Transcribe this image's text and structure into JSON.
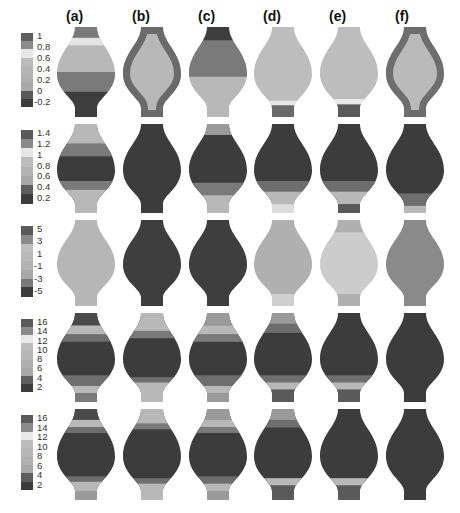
{
  "figure": {
    "column_labels": [
      "(a)",
      "(b)",
      "(c)",
      "(d)",
      "(e)",
      "(f)"
    ],
    "column_centers": [
      86,
      152,
      218,
      283,
      349,
      415
    ],
    "rows": [
      {
        "top": 27,
        "height": 90,
        "colorbar": {
          "ticks": [
            "1",
            "0.8",
            "0.6",
            "0.4",
            "0.2",
            "0",
            "-0.2"
          ],
          "segments": [
            "#5e5e5e",
            "#8a8a8a",
            "#e6e6e6",
            "#bcbcbc",
            "#b4b4b4",
            "#b0b0b0",
            "#a8a8a8",
            "#5a5a5a",
            "#3c3c3c"
          ]
        },
        "shapes": [
          {
            "base": "#b8b8b8",
            "bands": [
              {
                "from": 0,
                "to": 0.12,
                "color": "#7a7a7a"
              },
              {
                "from": 0.12,
                "to": 0.2,
                "color": "#e4e4e4"
              },
              {
                "from": 0.5,
                "to": 0.72,
                "color": "#7a7a7a"
              },
              {
                "from": 0.72,
                "to": 1,
                "color": "#3e3e3e"
              }
            ]
          },
          {
            "base": "#b8b8b8",
            "bands": [],
            "edge": "#6a6a6a"
          },
          {
            "base": "#b8b8b8",
            "bands": [
              {
                "from": 0,
                "to": 0.15,
                "color": "#3e3e3e"
              },
              {
                "from": 0.15,
                "to": 0.55,
                "color": "#7a7a7a"
              }
            ]
          },
          {
            "base": "#bdbdbd",
            "bands": [
              {
                "from": 0.82,
                "to": 0.87,
                "color": "#e8e8e8"
              },
              {
                "from": 0.87,
                "to": 1,
                "color": "#6a6a6a"
              }
            ]
          },
          {
            "base": "#bdbdbd",
            "bands": [
              {
                "from": 0.8,
                "to": 0.86,
                "color": "#e8e8e8"
              },
              {
                "from": 0.86,
                "to": 1,
                "color": "#5a5a5a"
              }
            ]
          },
          {
            "base": "#bababa",
            "bands": [],
            "edge": "#6e6e6e"
          }
        ]
      },
      {
        "top": 124,
        "height": 89,
        "colorbar": {
          "ticks": [
            "1.4",
            "1.2",
            "1",
            "0.8",
            "0.6",
            "0.4",
            "0.2"
          ],
          "segments": [
            "#5a5a5a",
            "#8a8a8a",
            "#e6e6e6",
            "#bcbcbc",
            "#b2b2b2",
            "#a8a8a8",
            "#5e5e5e",
            "#3c3c3c"
          ]
        },
        "shapes": [
          {
            "base": "#3c3c3c",
            "bands": [
              {
                "from": 0,
                "to": 0.22,
                "color": "#b8b8b8"
              },
              {
                "from": 0.22,
                "to": 0.36,
                "color": "#7a7a7a"
              },
              {
                "from": 0.64,
                "to": 0.74,
                "color": "#7a7a7a"
              },
              {
                "from": 0.74,
                "to": 1,
                "color": "#b8b8b8"
              }
            ]
          },
          {
            "base": "#3c3c3c",
            "bands": []
          },
          {
            "base": "#3c3c3c",
            "bands": [
              {
                "from": 0,
                "to": 0.12,
                "color": "#9a9a9a"
              },
              {
                "from": 0.66,
                "to": 0.8,
                "color": "#7a7a7a"
              },
              {
                "from": 0.8,
                "to": 1,
                "color": "#b8b8b8"
              }
            ]
          },
          {
            "base": "#3c3c3c",
            "bands": [
              {
                "from": 0.64,
                "to": 0.76,
                "color": "#6e6e6e"
              },
              {
                "from": 0.76,
                "to": 0.9,
                "color": "#b8b8b8"
              },
              {
                "from": 0.9,
                "to": 1,
                "color": "#dcdcdc"
              }
            ]
          },
          {
            "base": "#3c3c3c",
            "bands": [
              {
                "from": 0.64,
                "to": 0.76,
                "color": "#6e6e6e"
              },
              {
                "from": 0.76,
                "to": 0.9,
                "color": "#b8b8b8"
              },
              {
                "from": 0.9,
                "to": 1,
                "color": "#5a5a5a"
              }
            ]
          },
          {
            "base": "#3c3c3c",
            "bands": [
              {
                "from": 0.78,
                "to": 0.92,
                "color": "#6e6e6e"
              },
              {
                "from": 0.92,
                "to": 1,
                "color": "#b8b8b8"
              }
            ]
          }
        ]
      },
      {
        "top": 220,
        "height": 86,
        "colorbar": {
          "ticks": [
            "5",
            "3",
            "1",
            "-1",
            "-3",
            "-5"
          ],
          "segments": [
            "#5a5a5a",
            "#8a8a8a",
            "#bdbdbd",
            "#b8b8b8",
            "#b2b2b2",
            "#a8a8a8",
            "#7a7a7a",
            "#3c3c3c"
          ]
        },
        "shapes": [
          {
            "base": "#b6b6b6",
            "bands": []
          },
          {
            "base": "#3e3e3e",
            "bands": []
          },
          {
            "base": "#3e3e3e",
            "bands": []
          },
          {
            "base": "#b0b0b0",
            "bands": [
              {
                "from": 0.86,
                "to": 1,
                "color": "#cfcfcf"
              }
            ]
          },
          {
            "base": "#cccccc",
            "bands": [
              {
                "from": 0,
                "to": 0.14,
                "color": "#b0b0b0"
              },
              {
                "from": 0.86,
                "to": 1,
                "color": "#b0b0b0"
              }
            ]
          },
          {
            "base": "#8a8a8a",
            "bands": []
          }
        ]
      },
      {
        "top": 313,
        "height": 89,
        "colorbar": {
          "ticks": [
            "16",
            "14",
            "12",
            "10",
            "8",
            "6",
            "4",
            "2"
          ],
          "segments": [
            "#5a5a5a",
            "#8a8a8a",
            "#e8e8e8",
            "#bcbcbc",
            "#b6b6b6",
            "#b0b0b0",
            "#a8a8a8",
            "#5e5e5e",
            "#3c3c3c"
          ]
        },
        "shapes": [
          {
            "base": "#3c3c3c",
            "bands": [
              {
                "from": 0,
                "to": 0.14,
                "color": "#4a4a4a"
              },
              {
                "from": 0.14,
                "to": 0.24,
                "color": "#b8b8b8"
              },
              {
                "from": 0.24,
                "to": 0.32,
                "color": "#6e6e6e"
              },
              {
                "from": 0.7,
                "to": 0.82,
                "color": "#6e6e6e"
              },
              {
                "from": 0.82,
                "to": 0.9,
                "color": "#b8b8b8"
              },
              {
                "from": 0.9,
                "to": 1,
                "color": "#7a7a7a"
              }
            ]
          },
          {
            "base": "#3c3c3c",
            "bands": [
              {
                "from": 0,
                "to": 0.2,
                "color": "#b8b8b8"
              },
              {
                "from": 0.2,
                "to": 0.28,
                "color": "#7a7a7a"
              },
              {
                "from": 0.72,
                "to": 0.78,
                "color": "#6e6e6e"
              },
              {
                "from": 0.78,
                "to": 1,
                "color": "#b8b8b8"
              }
            ]
          },
          {
            "base": "#3c3c3c",
            "bands": [
              {
                "from": 0,
                "to": 0.14,
                "color": "#9a9a9a"
              },
              {
                "from": 0.14,
                "to": 0.24,
                "color": "#b8b8b8"
              },
              {
                "from": 0.24,
                "to": 0.32,
                "color": "#7a7a7a"
              },
              {
                "from": 0.7,
                "to": 0.82,
                "color": "#6e6e6e"
              },
              {
                "from": 0.82,
                "to": 0.9,
                "color": "#b8b8b8"
              },
              {
                "from": 0.9,
                "to": 1,
                "color": "#9a9a9a"
              }
            ]
          },
          {
            "base": "#3c3c3c",
            "bands": [
              {
                "from": 0,
                "to": 0.12,
                "color": "#9a9a9a"
              },
              {
                "from": 0.12,
                "to": 0.22,
                "color": "#6e6e6e"
              },
              {
                "from": 0.7,
                "to": 0.78,
                "color": "#6e6e6e"
              },
              {
                "from": 0.78,
                "to": 0.86,
                "color": "#b8b8b8"
              },
              {
                "from": 0.86,
                "to": 1,
                "color": "#5a5a5a"
              }
            ]
          },
          {
            "base": "#3c3c3c",
            "bands": [
              {
                "from": 0.7,
                "to": 0.78,
                "color": "#6e6e6e"
              },
              {
                "from": 0.78,
                "to": 0.86,
                "color": "#b8b8b8"
              },
              {
                "from": 0.86,
                "to": 1,
                "color": "#5a5a5a"
              }
            ]
          },
          {
            "base": "#3c3c3c",
            "bands": []
          }
        ]
      },
      {
        "top": 409,
        "height": 91,
        "colorbar": {
          "ticks": [
            "16",
            "14",
            "12",
            "10",
            "8",
            "6",
            "4",
            "2"
          ],
          "segments": [
            "#5a5a5a",
            "#8a8a8a",
            "#e8e8e8",
            "#bcbcbc",
            "#b6b6b6",
            "#b0b0b0",
            "#a8a8a8",
            "#5e5e5e",
            "#3c3c3c"
          ]
        },
        "shapes": [
          {
            "base": "#3c3c3c",
            "bands": [
              {
                "from": 0,
                "to": 0.12,
                "color": "#4a4a4a"
              },
              {
                "from": 0.12,
                "to": 0.2,
                "color": "#b8b8b8"
              },
              {
                "from": 0.2,
                "to": 0.26,
                "color": "#6e6e6e"
              },
              {
                "from": 0.74,
                "to": 0.8,
                "color": "#6e6e6e"
              },
              {
                "from": 0.8,
                "to": 0.9,
                "color": "#b8b8b8"
              },
              {
                "from": 0.9,
                "to": 1,
                "color": "#9a9a9a"
              }
            ]
          },
          {
            "base": "#3c3c3c",
            "bands": [
              {
                "from": 0,
                "to": 0.16,
                "color": "#b8b8b8"
              },
              {
                "from": 0.16,
                "to": 0.22,
                "color": "#7a7a7a"
              },
              {
                "from": 0.76,
                "to": 0.82,
                "color": "#6e6e6e"
              },
              {
                "from": 0.82,
                "to": 1,
                "color": "#b8b8b8"
              }
            ]
          },
          {
            "base": "#3c3c3c",
            "bands": [
              {
                "from": 0,
                "to": 0.12,
                "color": "#9a9a9a"
              },
              {
                "from": 0.12,
                "to": 0.2,
                "color": "#b8b8b8"
              },
              {
                "from": 0.2,
                "to": 0.26,
                "color": "#7a7a7a"
              },
              {
                "from": 0.74,
                "to": 0.82,
                "color": "#6e6e6e"
              },
              {
                "from": 0.82,
                "to": 0.9,
                "color": "#b8b8b8"
              },
              {
                "from": 0.9,
                "to": 1,
                "color": "#9a9a9a"
              }
            ]
          },
          {
            "base": "#3c3c3c",
            "bands": [
              {
                "from": 0,
                "to": 0.12,
                "color": "#9a9a9a"
              },
              {
                "from": 0.12,
                "to": 0.2,
                "color": "#6e6e6e"
              },
              {
                "from": 0.76,
                "to": 0.84,
                "color": "#b8b8b8"
              },
              {
                "from": 0.84,
                "to": 1,
                "color": "#5a5a5a"
              }
            ]
          },
          {
            "base": "#3c3c3c",
            "bands": [
              {
                "from": 0.76,
                "to": 0.84,
                "color": "#b8b8b8"
              },
              {
                "from": 0.84,
                "to": 1,
                "color": "#5a5a5a"
              }
            ]
          },
          {
            "base": "#3c3c3c",
            "bands": []
          }
        ]
      }
    ]
  }
}
